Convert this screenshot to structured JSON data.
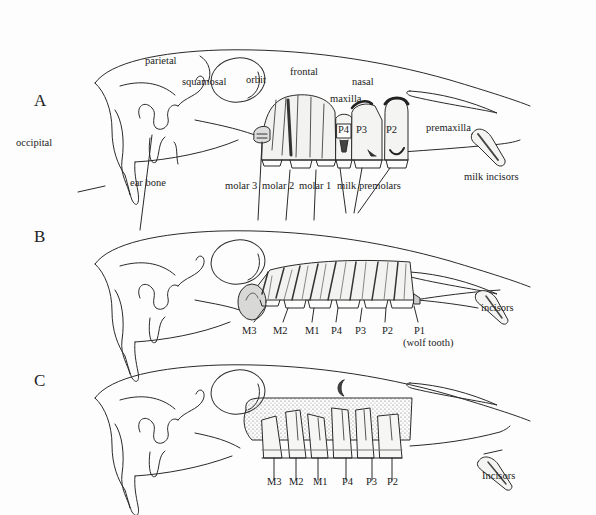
{
  "figure": {
    "panels": [
      {
        "letter": "A",
        "bone_labels": {
          "parietal": "parietal",
          "squamosal": "squamosal",
          "orbit": "orbit",
          "frontal": "frontal",
          "nasal": "nasal",
          "maxilla": "maxilla",
          "premaxilla": "premaxilla",
          "occipital": "occipital",
          "ear_bone": "ear bone"
        },
        "tooth_labels": {
          "molar_3": "molar 3",
          "molar_2": "molar 2",
          "molar_1": "molar 1",
          "milk_premolars": "milk premolars",
          "milk_incisors": "milk incisors"
        },
        "in_tooth_labels": [
          "P4",
          "P3",
          "P2"
        ]
      },
      {
        "letter": "B",
        "tooth_labels": [
          "M3",
          "M2",
          "M1",
          "P4",
          "P3",
          "P2",
          "P1"
        ],
        "p1_note": "(wolf tooth)",
        "incisors": "incisors"
      },
      {
        "letter": "C",
        "tooth_labels": [
          "M3",
          "M2",
          "M1",
          "P4",
          "P3",
          "P2"
        ],
        "incisors": "Incisors"
      }
    ]
  },
  "colors": {
    "line": "#2a2a2a",
    "tooth_fill": "#f4f4f2",
    "shade": "#6b6b6b",
    "stipple": "#8a8a8a",
    "background": "#fdfdfd"
  }
}
